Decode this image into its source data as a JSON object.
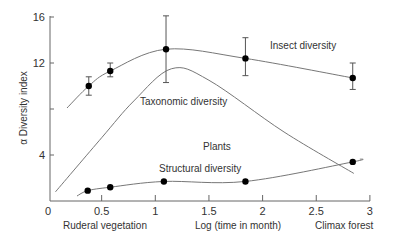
{
  "chart_data": {
    "type": "line",
    "title": "",
    "xlabel": "Log (time in month)",
    "ylabel": "α Diversity index",
    "xlim": [
      0,
      3
    ],
    "ylim": [
      0,
      16
    ],
    "x_ticks": [
      "0",
      "0.5",
      "1",
      "1.5",
      "2",
      "2.5",
      "3"
    ],
    "y_ticks": [
      "4",
      "12",
      "16"
    ],
    "grid": false,
    "annotations": {
      "left": "Ruderal vegetation",
      "right": "Climax forest",
      "plants": "Plants"
    },
    "series": [
      {
        "name": "Insect diversity",
        "markers": true,
        "points": [
          {
            "x": 0.38,
            "y": 10.0,
            "err_low": 9.2,
            "err_high": 10.8
          },
          {
            "x": 0.58,
            "y": 11.3,
            "err_low": 10.8,
            "err_high": 12.0
          },
          {
            "x": 1.1,
            "y": 13.2,
            "err_low": 10.3,
            "err_high": 16.1
          },
          {
            "x": 1.84,
            "y": 12.4,
            "err_low": 10.9,
            "err_high": 14.2
          },
          {
            "x": 2.84,
            "y": 10.7,
            "err_low": 9.7,
            "err_high": 12.0
          }
        ]
      },
      {
        "name": "Taxonomic diversity",
        "markers": false,
        "points": [
          {
            "x": 0.07,
            "y": 0.8
          },
          {
            "x": 0.5,
            "y": 5.5
          },
          {
            "x": 0.8,
            "y": 8.7
          },
          {
            "x": 1.15,
            "y": 11.5
          },
          {
            "x": 1.5,
            "y": 10.5
          },
          {
            "x": 2.2,
            "y": 6.0
          },
          {
            "x": 2.85,
            "y": 2.4
          }
        ]
      },
      {
        "name": "Structural diversity",
        "markers": true,
        "points": [
          {
            "x": 0.37,
            "y": 0.9
          },
          {
            "x": 0.58,
            "y": 1.2
          },
          {
            "x": 1.08,
            "y": 1.7
          },
          {
            "x": 1.84,
            "y": 1.7
          },
          {
            "x": 2.84,
            "y": 3.4
          }
        ]
      }
    ]
  }
}
